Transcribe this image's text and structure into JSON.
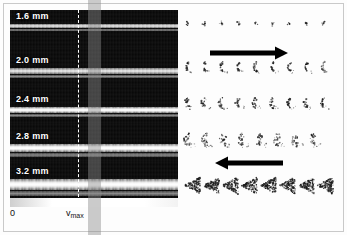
{
  "figure": {
    "type": "velocity-spectrogram-with-particle-pattern-array",
    "background_color": "#fdfdfd",
    "frame_color": "#c9c9c9",
    "caption": ""
  },
  "left_panel": {
    "name": "spectrogram-stack",
    "background_color": "#000000",
    "strips": [
      {
        "label": "1.6 mm",
        "band_offset_pct": 38,
        "band_height_px": 4,
        "band_style": "thin"
      },
      {
        "label": "2.0 mm",
        "band_offset_pct": 52,
        "band_height_px": 6,
        "band_style": "thin"
      },
      {
        "label": "2.4 mm",
        "band_offset_pct": 55,
        "band_height_px": 6,
        "band_style": "normal"
      },
      {
        "label": "2.8 mm",
        "band_offset_pct": 52,
        "band_height_px": 8,
        "band_style": "normal"
      },
      {
        "label": "3.2 mm",
        "band_offset_pct": 46,
        "band_height_px": 11,
        "band_style": "normal"
      }
    ],
    "marker": {
      "name": "vmax-dashed-line",
      "style": "dashed",
      "color": "#ffffff",
      "x_px": 78
    },
    "highlight_band": {
      "name": "velocity-highlight-band",
      "color": "rgba(140,140,140,0.45)",
      "x_px": 88,
      "width_px": 13
    }
  },
  "axis": {
    "name": "velocity-axis",
    "orientation": "horizontal",
    "ticks": [
      {
        "label": "0",
        "position_px": 10
      },
      {
        "label": "v",
        "sub": "max",
        "position_px": 66
      }
    ]
  },
  "right_panel": {
    "name": "glyph-panel",
    "rows": [
      {
        "name": "glyph-row-1",
        "pattern": "sparse-specks",
        "count": 9,
        "top_px": 8,
        "size_px": 11,
        "gap_px": 6,
        "density": 0.18
      },
      {
        "name": "glyph-row-2",
        "pattern": "small-crescent",
        "count": 9,
        "top_px": 52,
        "size_px": 14,
        "gap_px": 3,
        "density": 0.42
      },
      {
        "name": "glyph-row-3",
        "pattern": "open-crescent",
        "count": 9,
        "top_px": 88,
        "size_px": 14,
        "gap_px": 3,
        "density": 0.48
      },
      {
        "name": "glyph-row-4",
        "pattern": "dense-crescent",
        "count": 8,
        "top_px": 124,
        "size_px": 16,
        "gap_px": 2,
        "density": 0.66
      },
      {
        "name": "glyph-row-5",
        "pattern": "dense-fan-triangle",
        "count": 8,
        "top_px": 168,
        "size_px": 19,
        "gap_px": 0,
        "density": 0.92
      }
    ],
    "arrows": [
      {
        "name": "flow-arrow-right",
        "direction": "right",
        "top_px": 36,
        "left_px": 28,
        "length_px": 78,
        "color": "#000000"
      },
      {
        "name": "flow-arrow-left",
        "direction": "left",
        "top_px": 146,
        "left_px": 33,
        "length_px": 68,
        "color": "#000000"
      }
    ]
  },
  "chart_data": {
    "type": "heatmap",
    "title": "",
    "xlabel": "velocity",
    "ylabel": "depth",
    "x_tick_labels": [
      "0",
      "vmax"
    ],
    "y_tick_labels": [
      "1.6 mm",
      "2.0 mm",
      "2.4 mm",
      "2.8 mm",
      "3.2 mm"
    ],
    "grid": false,
    "legend_position": "none",
    "annotations": [
      "arrow pointing right",
      "arrow pointing left"
    ],
    "series": [
      {
        "name": "1.6 mm",
        "band_center_pct": 38,
        "band_width_px": 4,
        "intensity": 0.45
      },
      {
        "name": "2.0 mm",
        "band_center_pct": 52,
        "band_width_px": 6,
        "intensity": 0.55
      },
      {
        "name": "2.4 mm",
        "band_center_pct": 55,
        "band_width_px": 6,
        "intensity": 0.62
      },
      {
        "name": "2.8 mm",
        "band_center_pct": 52,
        "band_width_px": 8,
        "intensity": 0.78
      },
      {
        "name": "3.2 mm",
        "band_center_pct": 46,
        "band_width_px": 11,
        "intensity": 0.95
      }
    ]
  }
}
